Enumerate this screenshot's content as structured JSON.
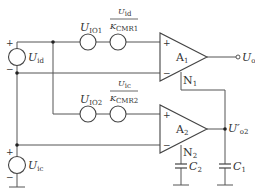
{
  "diagram": {
    "sources": {
      "uid": {
        "symbol": "U",
        "subscript": "id",
        "plus": "+",
        "minus": "−"
      },
      "uic": {
        "symbol": "U",
        "subscript": "ic",
        "plus": "+",
        "minus": "−"
      },
      "uio1": {
        "symbol": "U",
        "subscript": "IO1"
      },
      "uio2": {
        "symbol": "U",
        "subscript": "IO2"
      },
      "cmr1": {
        "num_symbol": "U",
        "num_subscript": "id",
        "den_symbol": "K",
        "den_subscript": "CMR1"
      },
      "cmr2": {
        "num_symbol": "U",
        "num_subscript": "ic",
        "den_symbol": "K",
        "den_subscript": "CMR2"
      }
    },
    "amplifiers": {
      "a1": {
        "label": "A",
        "subscript": "1",
        "plus": "+",
        "minus": "−",
        "node": "N",
        "node_sub": "1"
      },
      "a2": {
        "label": "A",
        "subscript": "2",
        "plus": "+",
        "minus": "−",
        "node": "N",
        "node_sub": "2"
      }
    },
    "outputs": {
      "uo": {
        "symbol": "U",
        "subscript": "o"
      },
      "uo2": {
        "symbol": "U′",
        "subscript": "o2"
      }
    },
    "capacitors": {
      "c1": {
        "symbol": "C",
        "subscript": "1"
      },
      "c2": {
        "symbol": "C",
        "subscript": "2"
      }
    },
    "colors": {
      "line": "#555555",
      "text": "#333333",
      "background": "#ffffff"
    }
  }
}
